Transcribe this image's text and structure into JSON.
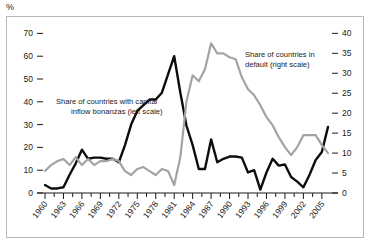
{
  "unit_label": "%",
  "chart_data": {
    "type": "line",
    "title": "",
    "xlabel": "",
    "ylabel": "",
    "grid": false,
    "legend_position": "inline-annotation",
    "x": [
      1960,
      1961,
      1962,
      1963,
      1964,
      1965,
      1966,
      1967,
      1968,
      1969,
      1970,
      1971,
      1972,
      1973,
      1974,
      1975,
      1976,
      1977,
      1978,
      1979,
      1980,
      1981,
      1982,
      1983,
      1984,
      1985,
      1986,
      1987,
      1988,
      1989,
      1990,
      1991,
      1992,
      1993,
      1994,
      1995,
      1996,
      1997,
      1998,
      1999,
      2000,
      2001,
      2002,
      2003,
      2004,
      2005,
      2006
    ],
    "xticks": [
      1960,
      1963,
      1966,
      1969,
      1972,
      1975,
      1978,
      1981,
      1984,
      1987,
      1990,
      1993,
      1996,
      1999,
      2002,
      2005
    ],
    "xtick_labels": [
      "1960",
      "1963",
      "1966",
      "1969",
      "1972",
      "1975",
      "1978",
      "1981",
      "1984",
      "1987",
      "1990",
      "1993",
      "1996",
      "1999",
      "2002",
      "2005"
    ],
    "left_axis": {
      "label": "",
      "ylim": [
        0,
        75
      ],
      "ticks": [
        0,
        10,
        20,
        30,
        40,
        50,
        60,
        70
      ],
      "tick_labels": [
        "0",
        "10",
        "20",
        "30",
        "40",
        "50",
        "60",
        "70"
      ]
    },
    "right_axis": {
      "label": "",
      "ylim": [
        0,
        42.85
      ],
      "ticks": [
        0,
        5,
        10,
        15,
        20,
        25,
        30,
        35,
        40
      ],
      "tick_labels": [
        "0",
        "5",
        "10",
        "15",
        "20",
        "25",
        "30",
        "35",
        "40"
      ]
    },
    "series": [
      {
        "name": "Share of countries with capital inflow bonanzas (left scale)",
        "short_name": "capital-inflow-bonanzas",
        "axis": "left",
        "color": "#0d0d0d",
        "annotation": "Share of countries with capital\ninflow bonanzas (left scale)",
        "values": [
          3.5,
          2.0,
          2.0,
          2.5,
          8.0,
          13.0,
          19.0,
          15.0,
          15.5,
          15.5,
          15.0,
          15.0,
          13.5,
          21.0,
          30.0,
          36.0,
          38.5,
          41.0,
          41.0,
          44.0,
          52.0,
          60.0,
          44.0,
          29.5,
          21.0,
          10.5,
          10.5,
          23.5,
          13.5,
          15.0,
          16.0,
          16.0,
          15.5,
          9.0,
          10.0,
          1.5,
          9.0,
          15.0,
          12.0,
          12.5,
          7.0,
          5.0,
          2.5,
          8.0,
          14.5,
          18.0,
          29.0
        ]
      },
      {
        "name": "Share of countries in default (right scale)",
        "short_name": "countries-in-default",
        "axis": "right",
        "color": "#a3a3a3",
        "annotation": "Share of countries in\ndefault (right scale)",
        "values": [
          5.5,
          7.0,
          8.0,
          8.5,
          7.0,
          9.0,
          7.0,
          8.5,
          7.0,
          8.0,
          8.0,
          8.5,
          8.0,
          5.5,
          4.5,
          6.0,
          6.5,
          5.5,
          4.5,
          6.0,
          5.5,
          2.0,
          9.0,
          23.0,
          29.5,
          28.0,
          31.0,
          37.5,
          35.0,
          35.0,
          34.0,
          33.5,
          29.0,
          26.0,
          24.5,
          22.0,
          19.0,
          17.0,
          14.0,
          11.5,
          9.5,
          11.5,
          14.5,
          14.5,
          14.5,
          12.0,
          10.0
        ]
      }
    ]
  },
  "annotations": [
    {
      "name": "bonanzas-annotation",
      "line1": "Share of countries with capital",
      "line2": "inflow bonanzas (left scale)"
    },
    {
      "name": "default-annotation",
      "line1": "Share of countries in",
      "line2": "default (right scale)"
    }
  ]
}
